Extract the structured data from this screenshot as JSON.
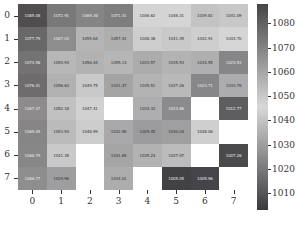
{
  "chart_data": {
    "type": "heatmap",
    "title": "",
    "xlabel": "",
    "ylabel": "",
    "x_categories": [
      "0",
      "1",
      "2",
      "3",
      "4",
      "5",
      "6",
      "7"
    ],
    "y_categories": [
      "0",
      "1",
      "2",
      "3",
      "4",
      "5",
      "6",
      "7"
    ],
    "values": [
      [
        1085.08,
        1072.91,
        1069.38,
        1071.31,
        1046.62,
        1046.31,
        1039.81,
        1041.09
      ],
      [
        1077.79,
        1067.04,
        1055.64,
        1057.41,
        1048.38,
        1041.45,
        1042.91,
        1044.7
      ],
      [
        1074.58,
        1054.93,
        1056.44,
        1055.13,
        1033.57,
        1035.53,
        1034.55,
        1023.53
      ],
      [
        1076.41,
        1056.63,
        1049.75,
        1031.47,
        1035.51,
        1037.26,
        1023.71,
        1033.79
      ],
      [
        1067.47,
        1052.18,
        1047.41,
        null,
        1034.33,
        1024.86,
        null,
        1012.77
      ],
      [
        1069.05,
        1053.93,
        1048.99,
        1032.98,
        1029.45,
        1030.04,
        1048.06,
        null
      ],
      [
        1068.79,
        1041.35,
        null,
        1031.65,
        1035.24,
        1037.97,
        null,
        1007.26
      ],
      [
        1066.77,
        1029.96,
        null,
        1034.01,
        null,
        1005.05,
        1005.96,
        null
      ]
    ],
    "colorbar": {
      "vmin": 1003,
      "vmax": 1088,
      "ticks": [
        1010,
        1020,
        1030,
        1040,
        1050,
        1060,
        1070,
        1080
      ],
      "colormap": "diverging-grey (dark-light-dark)"
    },
    "annotations": "cell values shown with 2 decimals; missing cells blank (white)"
  },
  "colors": {
    "low": "#3a3a3a",
    "mid_low": "#9a9a9a",
    "mid": "#d6d6d6",
    "mid_high": "#a0a0a0",
    "high": "#474747"
  }
}
